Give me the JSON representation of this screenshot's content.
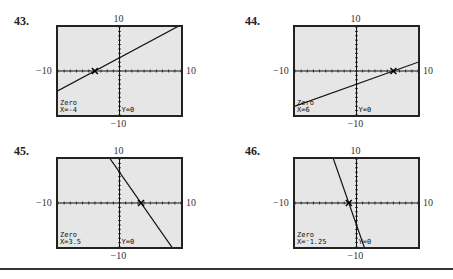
{
  "chart_data": [
    {
      "type": "line",
      "problem": "43.",
      "window": {
        "xmin": -10,
        "xmax": 10,
        "ymin": -10,
        "ymax": 10
      },
      "line": {
        "slope": 0.75,
        "intercept": 3
      },
      "zero": {
        "x": -4,
        "y": 0
      },
      "labels": {
        "top": "10",
        "bottom": "−10",
        "left": "−10",
        "right": "10"
      },
      "screen_text": {
        "mode": "Zero",
        "x": "X=-4",
        "y": "Y=0"
      }
    },
    {
      "type": "line",
      "problem": "44.",
      "window": {
        "xmin": -10,
        "xmax": 10,
        "ymin": -10,
        "ymax": 10
      },
      "line": {
        "slope": 0.5,
        "intercept": -3
      },
      "zero": {
        "x": 6,
        "y": 0
      },
      "labels": {
        "top": "10",
        "bottom": "−10",
        "left": "−10",
        "right": "10"
      },
      "screen_text": {
        "mode": "Zero",
        "x": "X=6",
        "y": "Y=0"
      }
    },
    {
      "type": "line",
      "problem": "45.",
      "window": {
        "xmin": -10,
        "xmax": 10,
        "ymin": -10,
        "ymax": 10
      },
      "line": {
        "slope": -2,
        "intercept": 7
      },
      "zero": {
        "x": 3.5,
        "y": 0
      },
      "labels": {
        "top": "10",
        "bottom": "−10",
        "left": "−10",
        "right": "10"
      },
      "screen_text": {
        "mode": "Zero",
        "x": "X=3.5",
        "y": "Y=0"
      }
    },
    {
      "type": "line",
      "problem": "46.",
      "window": {
        "xmin": -10,
        "xmax": 10,
        "ymin": -10,
        "ymax": 10
      },
      "line": {
        "slope": -4,
        "intercept": -5
      },
      "zero": {
        "x": -1.25,
        "y": 0
      },
      "labels": {
        "top": "10",
        "bottom": "−10",
        "left": "−10",
        "right": "10"
      },
      "screen_text": {
        "mode": "Zero",
        "x": "X=⁻1.25",
        "y": "Y=0"
      }
    }
  ]
}
